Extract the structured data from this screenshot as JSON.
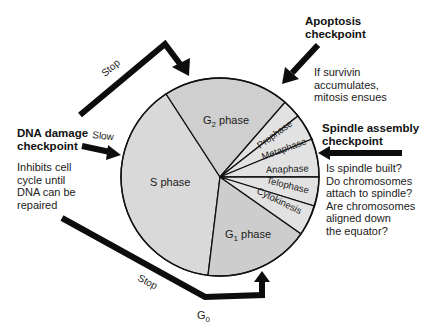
{
  "colors": {
    "g2_fill": "#cfcfcf",
    "s_fill": "#d9d9d9",
    "g1_fill": "#cdcdcd",
    "mitosis_fill": "#e2e2e2",
    "line": "#111111",
    "arrow": "#0d0d0d"
  },
  "circle": {
    "phases": [
      {
        "id": "g2",
        "label_main": "G",
        "label_sub": "2",
        "label_tail": " phase"
      },
      {
        "id": "s",
        "label": "S phase"
      },
      {
        "id": "g1",
        "label_main": "G",
        "label_sub": "1",
        "label_tail": " phase"
      }
    ],
    "mitosis_stages": [
      {
        "id": "prophase",
        "label": "Prophase"
      },
      {
        "id": "metaphase",
        "label": "Metaphase"
      },
      {
        "id": "anaphase",
        "label": "Anaphase"
      },
      {
        "id": "telophase",
        "label": "Telophase"
      },
      {
        "id": "cytokinesis",
        "label": "Cytokinesis"
      }
    ]
  },
  "checkpoints": {
    "dna_damage": {
      "title_line1": "DNA damage",
      "title_line2": "checkpoint",
      "desc_lines": [
        "Inhibits cell",
        "cycle until",
        "DNA can be",
        "repaired"
      ]
    },
    "apoptosis": {
      "title_line1": "Apoptosis",
      "title_line2": "checkpoint",
      "desc_lines": [
        "If survivin",
        "accumulates,",
        "mitosis ensues"
      ]
    },
    "spindle_assembly": {
      "title_line1": "Spindle assembly",
      "title_line2": "checkpoint",
      "desc_lines": [
        "Is spindle built?",
        "Do chromosomes",
        "attach to spindle?",
        "Are chromosomes",
        "aligned down",
        "the equator?"
      ]
    }
  },
  "arrows": {
    "top_stop": "Stop",
    "slow": "Slow",
    "bottom_stop": "Stop",
    "g0_main": "G",
    "g0_sub": "0"
  }
}
